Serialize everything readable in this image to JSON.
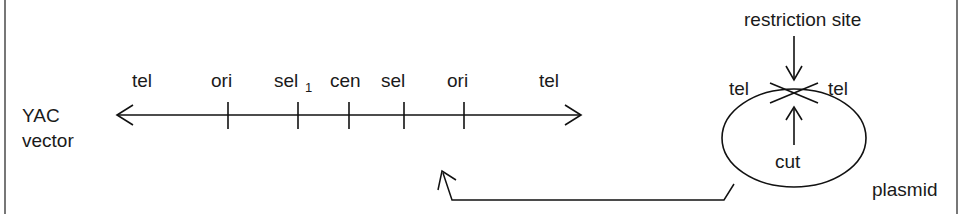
{
  "figure": {
    "background_color": "#ffffff",
    "ink_color": "#111111",
    "frame_color": "#555555"
  },
  "yac": {
    "name_line1": "YAC",
    "name_line2": "vector",
    "axis": {
      "left_arrow": true,
      "right_arrow": true,
      "x_start": 118,
      "x_end": 580,
      "y": 115
    },
    "markers": [
      {
        "label": "tel",
        "sub": "",
        "x_label": 147,
        "tick": false
      },
      {
        "label": "ori",
        "sub": "",
        "x_label": 228,
        "tick": true,
        "x_tick": 228
      },
      {
        "label": "sel",
        "sub": "1",
        "x_label": 295,
        "tick": true,
        "x_tick": 298
      },
      {
        "label": "cen",
        "sub": "",
        "x_label": 349,
        "tick": true,
        "x_tick": 349
      },
      {
        "label": "sel",
        "sub": "2",
        "x_label": 402,
        "tick": true,
        "x_tick": 404
      },
      {
        "label": "ori",
        "sub": "",
        "x_label": 464,
        "tick": true,
        "x_tick": 464
      },
      {
        "label": "tel",
        "sub": "",
        "x_label": 554,
        "tick": false
      }
    ]
  },
  "plasmid": {
    "label": "plasmid",
    "restriction_site_label": "restriction site",
    "cut_label": "cut",
    "tel_left_label": "tel",
    "tel_right_label": "tel",
    "ellipse": {
      "cx": 794,
      "cy": 138,
      "rx": 72,
      "ry": 49
    }
  },
  "connector": {
    "description": "arrow from plasmid to YAC vector line",
    "arrow_tip_x": 443,
    "arrow_tip_y": 172
  }
}
